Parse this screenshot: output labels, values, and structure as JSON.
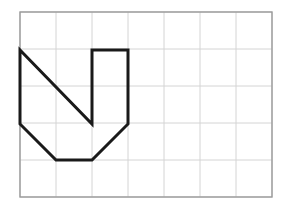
{
  "figure": {
    "background_color": "#ffffff",
    "grid": {
      "name": "square-grid",
      "origin_x": 20,
      "origin_y": 12,
      "cell_width": 36,
      "cell_height": 37,
      "columns": 7,
      "rows": 5,
      "left": 20,
      "top": 12,
      "right": 272,
      "bottom": 197,
      "line_color": "#d4d4d4",
      "line_width": 1,
      "border_color": "#9a9a9a",
      "border_width": 1.4,
      "vertical_lines_x": [
        20,
        56,
        92,
        128,
        164,
        200,
        236,
        272
      ],
      "horizontal_lines_y": [
        12,
        49,
        86,
        123,
        160,
        197
      ]
    },
    "shape": {
      "name": "checkmark-polygon",
      "stroke_color": "#1a1a1a",
      "stroke_width": 3,
      "fill": "none",
      "line_join": "miter",
      "line_cap": "butt",
      "closed": true,
      "points": [
        [
          20,
          50
        ],
        [
          92,
          124
        ],
        [
          92,
          50
        ],
        [
          128,
          50
        ],
        [
          128,
          124
        ],
        [
          92,
          160
        ],
        [
          56,
          160
        ],
        [
          20,
          124
        ]
      ],
      "points_attr": "20,50 92,124 92,50 128,50 128,124 92,160 56,160 20,124",
      "vertex_labels": [
        "top-left",
        "inner-notch-bottom",
        "inner-notch-top",
        "right-arm-top",
        "right-arm-bottom",
        "bottom-right-bevel",
        "bottom-left-bevel",
        "left-arm-bottom"
      ]
    }
  }
}
